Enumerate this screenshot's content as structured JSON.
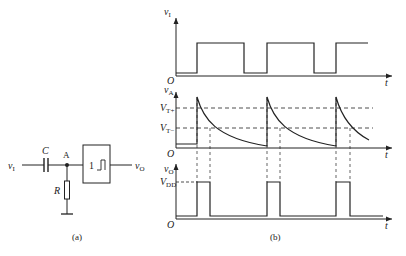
{
  "circuit": {
    "caption": "(a)",
    "input_label": "v",
    "input_sub": "I",
    "capacitor_label": "C",
    "node_label": "A",
    "resistor_label": "R",
    "gate_label": "1",
    "gate_symbol": "schmitt-trigger-icon",
    "output_label": "v",
    "output_sub": "O"
  },
  "waveforms": {
    "caption": "(b)",
    "origin_label": "O",
    "time_label": "t",
    "vi": {
      "label": "v",
      "sub": "I"
    },
    "va": {
      "label": "v",
      "sub": "A",
      "vt_plus": "V",
      "vt_plus_sub": "T+",
      "vt_minus": "V",
      "vt_minus_sub": "T−"
    },
    "vo": {
      "label": "v",
      "sub": "O",
      "vdd": "V",
      "vdd_sub": "DD"
    }
  },
  "colors": {
    "line": "#222222",
    "background": "#ffffff"
  }
}
